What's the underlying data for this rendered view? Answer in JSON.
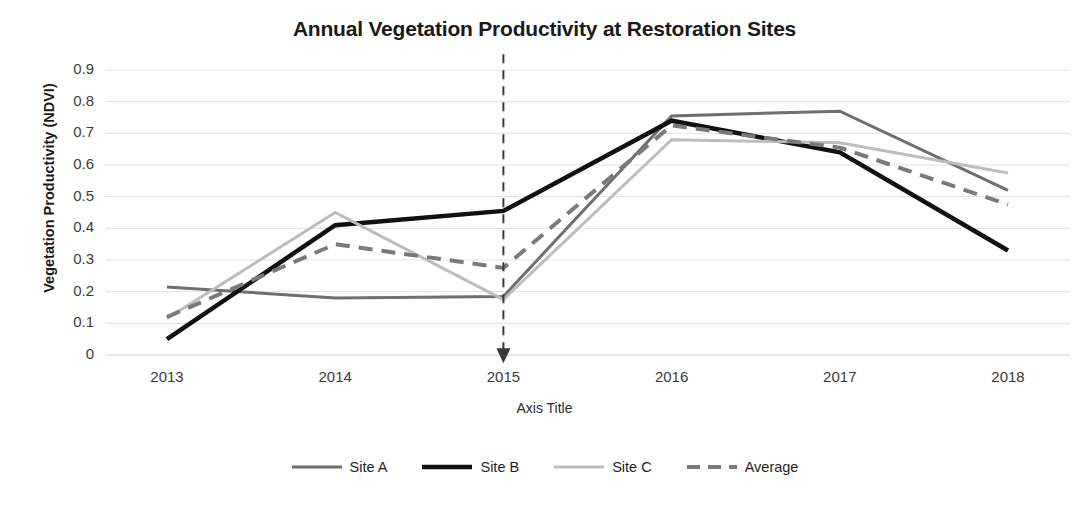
{
  "chart_data": {
    "type": "line",
    "title": "Annual Vegetation Productivity at Restoration Sites",
    "xlabel": "Axis Title",
    "ylabel": "Vegetation Productivity (NDVI)",
    "categories": [
      "2013",
      "2014",
      "2015",
      "2016",
      "2017",
      "2018"
    ],
    "ylim": [
      0,
      0.9
    ],
    "ytick_labels": [
      "0.9",
      "0.8",
      "0.7",
      "0.6",
      "0.5",
      "0.4",
      "0.3",
      "0.2",
      "0.1",
      "0"
    ],
    "ytick_values": [
      0.9,
      0.8,
      0.7,
      0.6,
      0.5,
      0.4,
      0.3,
      0.2,
      0.1,
      0
    ],
    "grid": true,
    "grid_axis": "y",
    "legend_position": "bottom",
    "series": [
      {
        "name": "Site A",
        "values": [
          0.215,
          0.18,
          0.185,
          0.755,
          0.77,
          0.52
        ],
        "color": "#6f6f6f",
        "width": 3,
        "dash": "none"
      },
      {
        "name": "Site B",
        "values": [
          0.05,
          0.41,
          0.455,
          0.74,
          0.64,
          0.33
        ],
        "color": "#111111",
        "width": 4.5,
        "dash": "none"
      },
      {
        "name": "Site C",
        "values": [
          0.115,
          0.45,
          0.175,
          0.68,
          0.67,
          0.575
        ],
        "color": "#bdbdbd",
        "width": 3,
        "dash": "none"
      },
      {
        "name": "Average",
        "values": [
          0.12,
          0.35,
          0.275,
          0.725,
          0.655,
          0.475
        ],
        "color": "#7a7a7a",
        "width": 4,
        "dash": "14 9"
      }
    ],
    "annotations": [
      {
        "type": "vertical-arrow",
        "at_category": "2015",
        "from_value": 0.95,
        "to_value": -0.02,
        "style": "dashed",
        "color": "#3a3a3a"
      }
    ]
  }
}
